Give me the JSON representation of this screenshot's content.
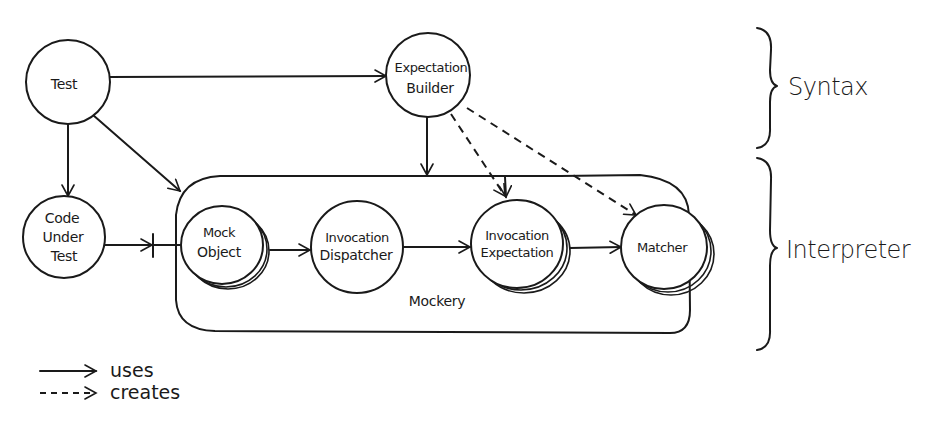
{
  "diagram": {
    "type": "component-architecture",
    "style": "hand-drawn",
    "colors": {
      "ink": "#1a1a1a",
      "background": "#ffffff"
    },
    "nodes": {
      "test": {
        "label_lines": [
          "Test"
        ]
      },
      "expectation_builder": {
        "label_lines": [
          "Expectation",
          "Builder"
        ]
      },
      "code_under_test": {
        "label_lines": [
          "Code",
          "Under",
          "Test"
        ]
      },
      "mock_object": {
        "label_lines": [
          "Mock",
          "Object"
        ],
        "stacked": true
      },
      "invocation_dispatcher": {
        "label_lines": [
          "Invocation",
          "Dispatcher"
        ]
      },
      "invocation_expectation": {
        "label_lines": [
          "Invocation",
          "Expectation"
        ],
        "stacked": true
      },
      "matcher": {
        "label_lines": [
          "Matcher"
        ],
        "stacked": true
      }
    },
    "groups": {
      "mockery": {
        "label": "Mockery"
      }
    },
    "layers": {
      "syntax": {
        "label": "Syntax"
      },
      "interpreter": {
        "label": "Interpreter"
      }
    },
    "edges": [
      {
        "from": "Test",
        "to": "Expectation Builder",
        "kind": "uses"
      },
      {
        "from": "Test",
        "to": "Code Under Test",
        "kind": "uses"
      },
      {
        "from": "Test",
        "to": "Mockery",
        "kind": "uses"
      },
      {
        "from": "Expectation Builder",
        "to": "Mockery",
        "kind": "uses"
      },
      {
        "from": "Expectation Builder",
        "to": "Invocation Expectation",
        "kind": "creates"
      },
      {
        "from": "Expectation Builder",
        "to": "Matcher",
        "kind": "creates"
      },
      {
        "from": "Code Under Test",
        "to": "Mock Object",
        "kind": "uses"
      },
      {
        "from": "Mock Object",
        "to": "Invocation Dispatcher",
        "kind": "uses"
      },
      {
        "from": "Invocation Dispatcher",
        "to": "Invocation Expectation",
        "kind": "uses"
      },
      {
        "from": "Invocation Expectation",
        "to": "Matcher",
        "kind": "uses"
      }
    ],
    "legend": {
      "uses": "uses",
      "creates": "creates"
    }
  }
}
